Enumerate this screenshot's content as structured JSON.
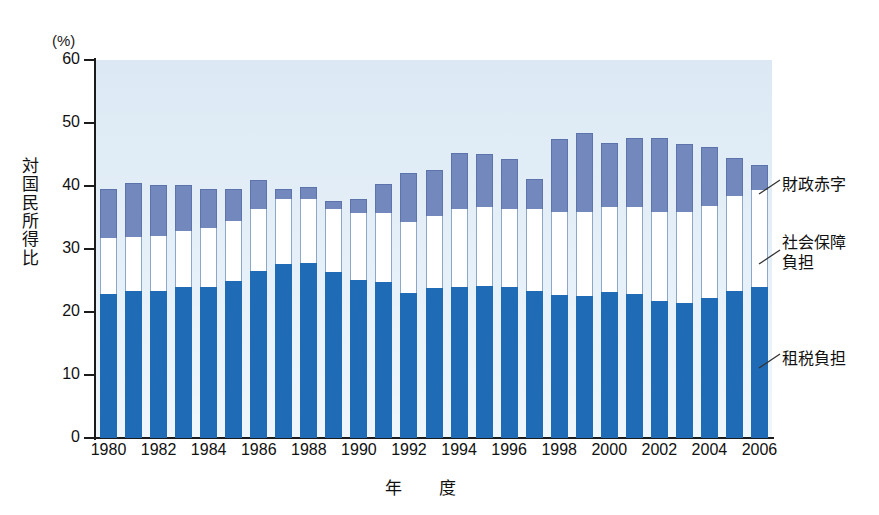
{
  "chart_data": {
    "type": "bar",
    "stacked": true,
    "title": "",
    "xlabel": "年　度",
    "ylabel": "対国民所得比",
    "yunit": "(%)",
    "ylim": [
      0,
      60
    ],
    "yticks": [
      0,
      10,
      20,
      30,
      40,
      50,
      60
    ],
    "ytick_labels": [
      "0",
      "10",
      "20",
      "30",
      "40",
      "50",
      "60"
    ],
    "grid": false,
    "legend_position": "right-outside",
    "x": [
      1980,
      1981,
      1982,
      1983,
      1984,
      1985,
      1986,
      1987,
      1988,
      1989,
      1990,
      1991,
      1992,
      1993,
      1994,
      1995,
      1996,
      1997,
      1998,
      1999,
      2000,
      2001,
      2002,
      2003,
      2004,
      2005,
      2006
    ],
    "xtick_labels": [
      "1980",
      "1982",
      "1984",
      "1986",
      "1988",
      "1990",
      "1992",
      "1994",
      "1996",
      "1998",
      "2000",
      "2002",
      "2004",
      "2006"
    ],
    "xtick_values": [
      1980,
      1982,
      1984,
      1986,
      1988,
      1990,
      1992,
      1994,
      1996,
      1998,
      2000,
      2002,
      2004,
      2006
    ],
    "series": [
      {
        "name": "租税負担",
        "color": "#1f6bb5",
        "values": [
          22.9,
          23.3,
          23.4,
          23.9,
          24.0,
          24.9,
          26.5,
          27.7,
          27.8,
          26.4,
          25.1,
          24.7,
          23.0,
          23.8,
          24.0,
          24.2,
          23.9,
          23.4,
          22.7,
          22.5,
          23.1,
          22.8,
          21.7,
          21.5,
          22.3,
          23.3,
          24.0
        ]
      },
      {
        "name": "社会保障負担",
        "color": "#ffffff",
        "values": [
          8.8,
          8.6,
          8.7,
          9.0,
          9.3,
          9.6,
          9.9,
          10.2,
          10.2,
          10.0,
          10.6,
          11.0,
          11.3,
          11.5,
          12.3,
          12.4,
          12.4,
          12.9,
          13.2,
          13.4,
          13.5,
          13.8,
          14.1,
          14.3,
          14.5,
          15.1,
          15.3
        ]
      },
      {
        "name": "財政赤字",
        "color": "#7389bd",
        "values": [
          7.9,
          8.6,
          8.0,
          7.2,
          6.3,
          5.0,
          4.6,
          1.6,
          1.8,
          1.2,
          2.3,
          4.6,
          7.7,
          7.3,
          8.9,
          8.5,
          8.0,
          4.8,
          11.6,
          12.5,
          10.2,
          11.1,
          11.9,
          10.8,
          9.4,
          6.1,
          4.0
        ]
      }
    ]
  },
  "axes": {
    "y_unit": "(%)",
    "y_title_chars": [
      "対",
      "国",
      "民",
      "所",
      "得",
      "比"
    ],
    "x_title": "年　度"
  },
  "legend": {
    "items": [
      {
        "label": "財政赤字",
        "series": "deficit"
      },
      {
        "label_line1": "社会保障",
        "label_line2": "負担",
        "series": "social"
      },
      {
        "label": "租税負担",
        "series": "tax"
      }
    ]
  },
  "colors": {
    "tax": "#1f6bb5",
    "social": "#ffffff",
    "deficit": "#7389bd",
    "plot_background_top": "#dce9f4",
    "plot_background_bottom": "#f0f7fc",
    "axis": "#1b1b1b",
    "text": "#111111"
  }
}
